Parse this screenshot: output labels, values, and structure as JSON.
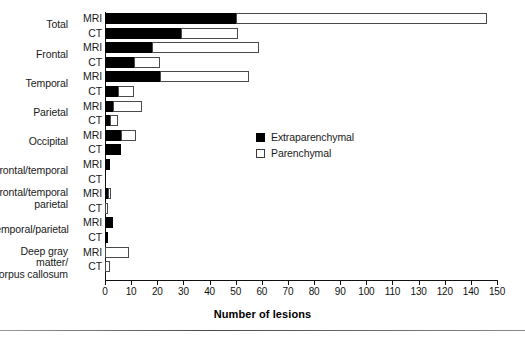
{
  "chart_data": {
    "type": "bar",
    "orientation": "horizontal",
    "title": "",
    "xlabel": "Number of lesions",
    "ylabel": "",
    "xlim": [
      0,
      150
    ],
    "xticks": [
      0,
      10,
      20,
      30,
      40,
      50,
      60,
      70,
      80,
      90,
      100,
      110,
      130,
      120,
      140,
      150
    ],
    "grid": false,
    "legend_position": "center",
    "stacked": true,
    "series": [
      {
        "name": "Extraparenchymal",
        "color": "#000000"
      },
      {
        "name": "Parenchymal",
        "color": "#ffffff"
      }
    ],
    "categories": [
      "Total",
      "Frontal",
      "Temporal",
      "Parietal",
      "Occipital",
      "Frontal/temporal",
      "Frontal/temporal parietal",
      "Temporal/parietal",
      "Deep gray matter/ corpus callosum"
    ],
    "modalities": [
      "MRI",
      "CT"
    ],
    "rows": [
      {
        "category": "Total",
        "modality": "MRI",
        "extraparenchymal": 50,
        "parenchymal": 96,
        "total": 146
      },
      {
        "category": "Total",
        "modality": "CT",
        "extraparenchymal": 29,
        "parenchymal": 22,
        "total": 51
      },
      {
        "category": "Frontal",
        "modality": "MRI",
        "extraparenchymal": 18,
        "parenchymal": 41,
        "total": 59
      },
      {
        "category": "Frontal",
        "modality": "CT",
        "extraparenchymal": 11,
        "parenchymal": 10,
        "total": 21
      },
      {
        "category": "Temporal",
        "modality": "MRI",
        "extraparenchymal": 21,
        "parenchymal": 34,
        "total": 55
      },
      {
        "category": "Temporal",
        "modality": "CT",
        "extraparenchymal": 5,
        "parenchymal": 6,
        "total": 11
      },
      {
        "category": "Parietal",
        "modality": "MRI",
        "extraparenchymal": 3,
        "parenchymal": 11,
        "total": 14
      },
      {
        "category": "Parietal",
        "modality": "CT",
        "extraparenchymal": 2,
        "parenchymal": 3,
        "total": 5
      },
      {
        "category": "Occipital",
        "modality": "MRI",
        "extraparenchymal": 6,
        "parenchymal": 6,
        "total": 12
      },
      {
        "category": "Occipital",
        "modality": "CT",
        "extraparenchymal": 6,
        "parenchymal": 0,
        "total": 6
      },
      {
        "category": "Frontal/temporal",
        "modality": "MRI",
        "extraparenchymal": 2,
        "parenchymal": 0,
        "total": 2
      },
      {
        "category": "Frontal/temporal",
        "modality": "CT",
        "extraparenchymal": 0,
        "parenchymal": 0,
        "total": 0
      },
      {
        "category": "Frontal/temporal parietal",
        "modality": "MRI",
        "extraparenchymal": 1,
        "parenchymal": 1,
        "total": 2
      },
      {
        "category": "Frontal/temporal parietal",
        "modality": "CT",
        "extraparenchymal": 0,
        "parenchymal": 1,
        "total": 1
      },
      {
        "category": "Temporal/parietal",
        "modality": "MRI",
        "extraparenchymal": 3,
        "parenchymal": 0,
        "total": 3
      },
      {
        "category": "Temporal/parietal",
        "modality": "CT",
        "extraparenchymal": 1,
        "parenchymal": 0,
        "total": 1
      },
      {
        "category": "Deep gray matter/ corpus callosum",
        "modality": "MRI",
        "extraparenchymal": 0,
        "parenchymal": 9,
        "total": 9
      },
      {
        "category": "Deep gray matter/ corpus callosum",
        "modality": "CT",
        "extraparenchymal": 0,
        "parenchymal": 2,
        "total": 2
      }
    ]
  },
  "legend": {
    "items": [
      {
        "label": "Extraparenchymal",
        "color": "#000000"
      },
      {
        "label": "Parenchymal",
        "color": "#ffffff"
      }
    ]
  },
  "axis": {
    "x_title": "Number of lesions"
  }
}
